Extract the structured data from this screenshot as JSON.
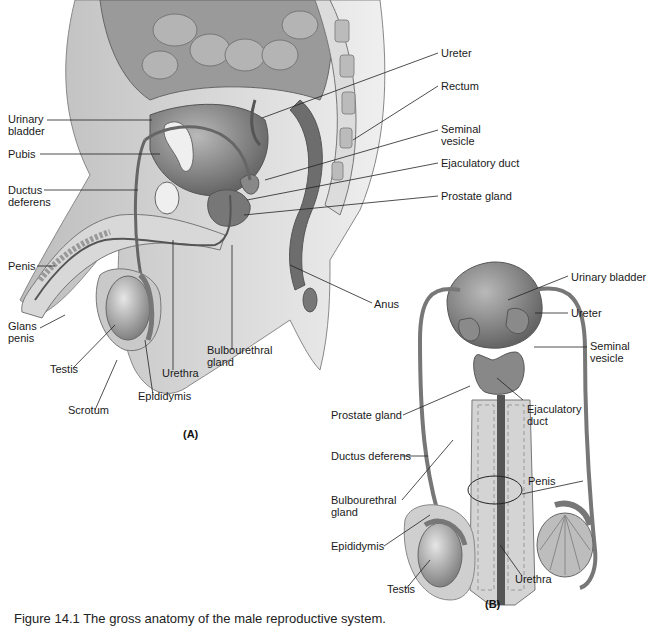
{
  "figure": {
    "panel_a": {
      "tag": "(A)",
      "labels": {
        "urinary_bladder": "Urinary\nbladder",
        "pubis": "Pubis",
        "ductus_deferens": "Ductus\ndeferens",
        "penis": "Penis",
        "glans_penis": "Glans\npenis",
        "testis": "Testis",
        "scrotum": "Scrotum",
        "epididymis": "Epididymis",
        "urethra": "Urethra",
        "bulbourethral_gland": "Bulbourethral\ngland",
        "ureter": "Ureter",
        "rectum": "Rectum",
        "seminal_vesicle": "Seminal\nvesicle",
        "ejaculatory_duct": "Ejaculatory duct",
        "prostate_gland": "Prostate gland",
        "anus": "Anus"
      }
    },
    "panel_b": {
      "tag": "(B)",
      "labels": {
        "urinary_bladder": "Urinary bladder",
        "ureter": "Ureter",
        "seminal_vesicle": "Seminal\nvesicle",
        "prostate_gland": "Prostate gland",
        "ejaculatory_duct": "Ejaculatory\nduct",
        "ductus_deferens": "Ductus deferens",
        "penis": "Penis",
        "bulbourethral_gland": "Bulbourethral\ngland",
        "epididymis": "Epididymis",
        "testis": "Testis",
        "urethra": "Urethra"
      }
    },
    "caption": "Figure 14.1  The gross anatomy of the male reproductive system."
  },
  "colors": {
    "tissue_dark": "#6e6e6e",
    "tissue_mid": "#a3a3a3",
    "tissue_light": "#d6d6d6",
    "skin": "#c9c9c9",
    "bone": "#eeeeee",
    "leader_line": "#222222"
  }
}
